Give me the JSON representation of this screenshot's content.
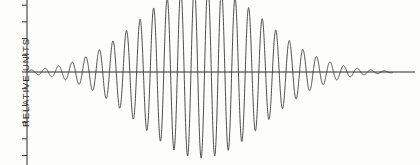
{
  "figure": {
    "background_color": "#fdfdfc",
    "ink_color": "#3a3a3a",
    "axis_color": "#2b2b2b",
    "width": 420,
    "height": 165
  },
  "axes": {
    "y_axis_label": "RELATIVE UNITS",
    "y_axis_x_px": 27,
    "baseline_y_px": 72,
    "tick_count": 10,
    "tick_spacing_px": 16.7,
    "tick_length_px": 5,
    "x_axis_label": "",
    "x_tick_labels": [],
    "y_tick_labels": []
  },
  "chart_data": {
    "type": "line",
    "title": "",
    "xlabel": "",
    "ylabel": "RELATIVE UNITS",
    "grid": false,
    "legend": null,
    "xlim": [
      0,
      100
    ],
    "ylim": [
      -1.05,
      1.05
    ],
    "envelope": {
      "type": "gaussian",
      "center_x": 47.5,
      "sigma_x": 17.0,
      "peak_amplitude": 1.0
    },
    "carrier": {
      "type": "sine",
      "period_x": 3.72,
      "cycles_visible": 27,
      "phase_deg": 0
    },
    "x": [
      0,
      2,
      4,
      6,
      8,
      10,
      12,
      14,
      16,
      18,
      20,
      22,
      24,
      26,
      28,
      30,
      32,
      34,
      36,
      38,
      40,
      42,
      44,
      46,
      48,
      50,
      52,
      54,
      56,
      58,
      60,
      62,
      64,
      66,
      68,
      70,
      72,
      74,
      76,
      78,
      80,
      82,
      84,
      86,
      88,
      90,
      92,
      94,
      96,
      98,
      100
    ],
    "envelope_values": [
      0.0004,
      0.0011,
      0.0027,
      0.0063,
      0.0139,
      0.0293,
      0.0588,
      0.1126,
      0.2057,
      0.3586,
      0.5969,
      0.9478,
      1.4358,
      2.0757,
      2.8658,
      3.7821,
      4.7747,
      5.7699,
      6.6762,
      7.3942,
      7.8314,
      7.9185,
      7.6263,
      6.9745,
      6.0317,
      4.9059,
      3.7281,
      2.6303,
      1.7262,
      1.0494,
      0.5933,
      0.3121,
      0.1527,
      0.0697,
      0.0296,
      0.0117,
      0.0043,
      0.0015,
      0.0005,
      0.0001,
      0.0,
      0.0,
      0.0,
      0.0,
      0.0,
      0.0,
      0.0,
      0.0,
      0.0,
      0.0,
      0.0
    ],
    "peaks": {
      "max_positive_value": 1.0,
      "max_negative_value": -1.0,
      "max_positive_x": 47.0,
      "max_negative_x": 48.9
    }
  }
}
